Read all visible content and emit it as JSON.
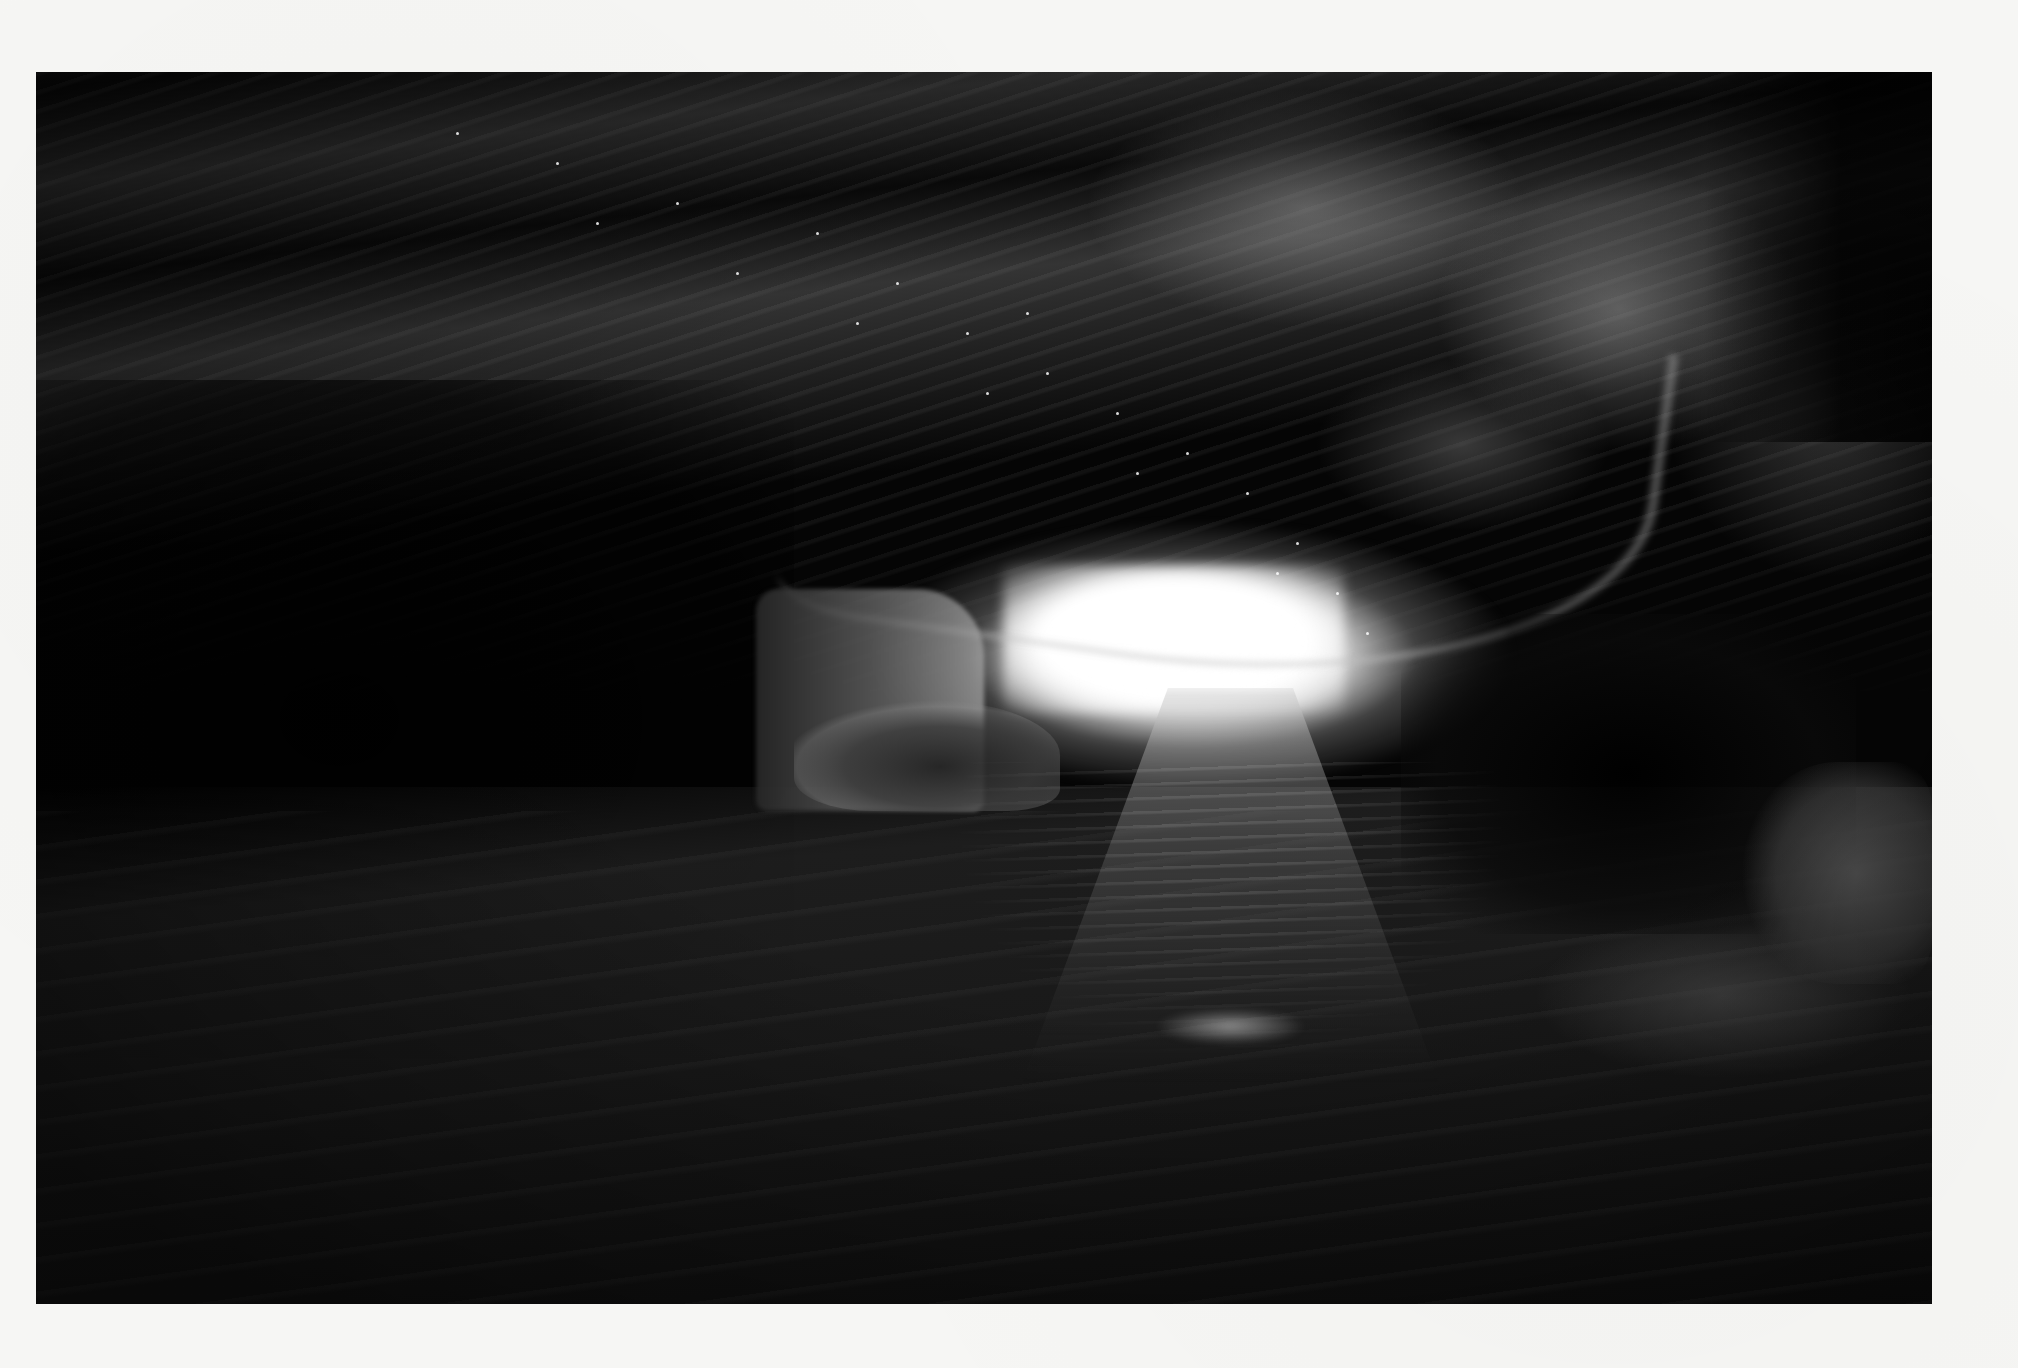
{
  "page": {
    "background_color": "#f6f6f4"
  },
  "photo": {
    "subject": "ice cave interior with bright opening and meltwater stream",
    "tone": "grayscale",
    "colors": {
      "shadow": "#050505",
      "midtone": "#5a5a5a",
      "highlight": "#ffffff"
    },
    "frame": {
      "x": 36,
      "y": 72,
      "width": 1896,
      "height": 1232
    }
  },
  "sparkles": [
    {
      "x": 520,
      "y": 90
    },
    {
      "x": 640,
      "y": 130
    },
    {
      "x": 780,
      "y": 160
    },
    {
      "x": 860,
      "y": 210
    },
    {
      "x": 930,
      "y": 260
    },
    {
      "x": 1010,
      "y": 300
    },
    {
      "x": 1080,
      "y": 340
    },
    {
      "x": 1150,
      "y": 380
    },
    {
      "x": 1210,
      "y": 420
    },
    {
      "x": 1260,
      "y": 470
    },
    {
      "x": 1300,
      "y": 520
    },
    {
      "x": 1330,
      "y": 560
    },
    {
      "x": 700,
      "y": 200
    },
    {
      "x": 820,
      "y": 250
    },
    {
      "x": 950,
      "y": 320
    },
    {
      "x": 1100,
      "y": 400
    },
    {
      "x": 1240,
      "y": 500
    },
    {
      "x": 420,
      "y": 60
    },
    {
      "x": 560,
      "y": 150
    },
    {
      "x": 990,
      "y": 240
    }
  ]
}
